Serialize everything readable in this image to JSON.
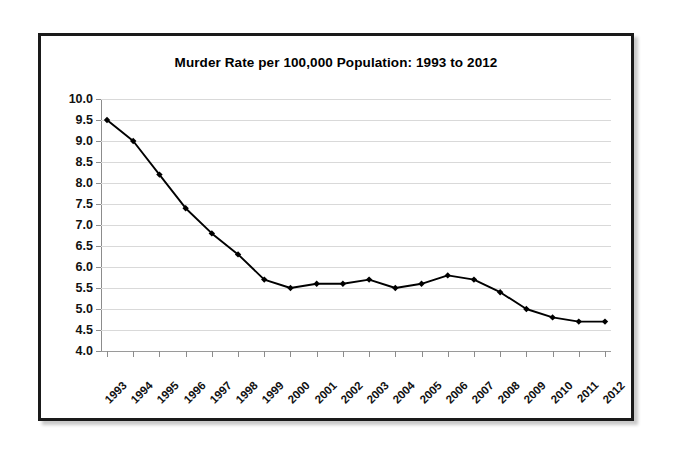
{
  "chart_data": {
    "type": "line",
    "title": "Murder Rate per 100,000 Population: 1993 to 2012",
    "xlabel": "",
    "ylabel": "",
    "categories": [
      "1993",
      "1994",
      "1995",
      "1996",
      "1997",
      "1998",
      "1999",
      "2000",
      "2001",
      "2002",
      "2003",
      "2004",
      "2005",
      "2006",
      "2007",
      "2008",
      "2009",
      "2010",
      "2011",
      "2012"
    ],
    "values": [
      9.5,
      9.0,
      8.2,
      7.4,
      6.8,
      6.3,
      5.7,
      5.5,
      5.6,
      5.6,
      5.7,
      5.5,
      5.6,
      5.8,
      5.7,
      5.4,
      5.0,
      4.8,
      4.7,
      4.7
    ],
    "series": [
      {
        "name": "Murder Rate",
        "values": [
          9.5,
          9.0,
          8.2,
          7.4,
          6.8,
          6.3,
          5.7,
          5.5,
          5.6,
          5.6,
          5.7,
          5.5,
          5.6,
          5.8,
          5.7,
          5.4,
          5.0,
          4.8,
          4.7,
          4.7
        ]
      }
    ],
    "ylim": [
      4.0,
      10.0
    ],
    "ytick_step": 0.5,
    "ytick_labels": [
      "10.0",
      "9.5",
      "9.0",
      "8.5",
      "8.0",
      "7.5",
      "7.0",
      "6.5",
      "6.0",
      "5.5",
      "5.0",
      "4.5",
      "4.0"
    ],
    "grid": true,
    "legend": false,
    "legend_position": "none",
    "line_color": "#000000",
    "marker_color": "#000000",
    "marker_shape": "diamond",
    "gridline_color": "#d9d9d9",
    "axis_color": "#8c8c8c",
    "background_color": "#ffffff",
    "frame_border_color": "#1a1a1a"
  }
}
